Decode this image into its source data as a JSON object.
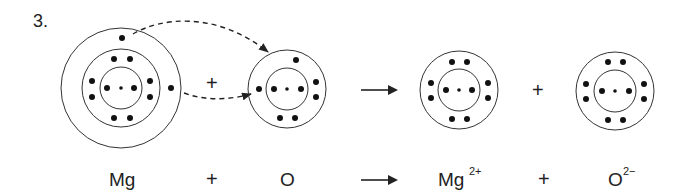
{
  "question_number": "3.",
  "equation": {
    "reactant_1": "Mg",
    "plus_1": "+",
    "reactant_2": "O",
    "product_1": "Mg",
    "product_1_charge": "2+",
    "plus_2": "+",
    "product_2": "O",
    "product_2_charge": "2−"
  },
  "diagram": {
    "plus_top_1": "+",
    "plus_top_2": "+",
    "atoms": [
      {
        "name": "Mg atom",
        "shells": [
          2,
          8,
          2
        ]
      },
      {
        "name": "O atom",
        "shells": [
          2,
          6
        ]
      },
      {
        "name": "Mg2+ ion",
        "shells": [
          2,
          8
        ]
      },
      {
        "name": "O2- ion",
        "shells": [
          2,
          8
        ]
      }
    ],
    "transfer_arrows": 2,
    "colors": {
      "ink": "#222222",
      "background": "#ffffff"
    }
  }
}
